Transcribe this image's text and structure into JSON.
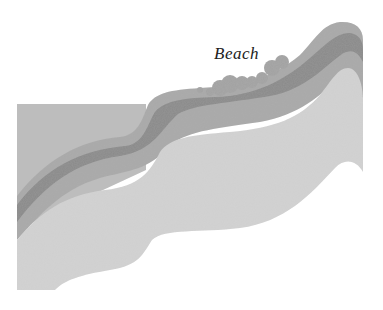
{
  "diagram": {
    "type": "cross-section",
    "labels": [
      {
        "id": "beach",
        "text": "Beach",
        "x": 214,
        "y": 44
      }
    ],
    "layers": [
      {
        "name": "upper-left-light-layer",
        "color": "#bdbdbd"
      },
      {
        "name": "outer-medium-band",
        "color": "#a9a9a9"
      },
      {
        "name": "dark-band",
        "color": "#8a8a8a"
      },
      {
        "name": "inner-medium-band",
        "color": "#a6a6a6"
      },
      {
        "name": "lower-light-region",
        "color": "#d3d3d3"
      },
      {
        "name": "beach-pebbles",
        "color": "#a3a3a3"
      }
    ]
  }
}
